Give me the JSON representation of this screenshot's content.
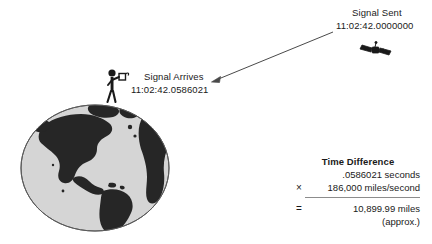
{
  "figure": {
    "type": "gps-signal-timing-diagram",
    "background_color": "#ffffff",
    "ink_color": "#1a1a1a"
  },
  "signal_sent": {
    "title": "Signal Sent",
    "timestamp": "11:02:42.0000000"
  },
  "signal_arrives": {
    "title": "Signal Arrives",
    "timestamp": "11:02:42.0586021"
  },
  "icons": {
    "satellite": "satellite-icon",
    "person": "person-with-gps-receiver-icon",
    "globe": "earth-globe-icon",
    "arrow": "signal-path-arrow-icon"
  },
  "calculation": {
    "title": "Time Difference",
    "rows": [
      {
        "operator": "",
        "value": ".0586021 seconds"
      },
      {
        "operator": "×",
        "value": "186,000 miles/second"
      }
    ],
    "result": {
      "operator": "=",
      "value": "10,899.99 miles"
    },
    "approx_note": "(approx.)"
  },
  "colors": {
    "globe_ocean": "#d5d5d5",
    "globe_land": "#262626",
    "globe_outline": "#5a5a5a",
    "rule": "#8c8c8c",
    "line": "#4a4a4a"
  }
}
